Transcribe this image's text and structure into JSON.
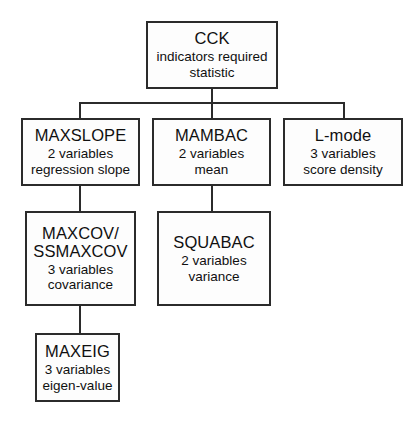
{
  "diagram": {
    "title": "CCK indicators required statistic",
    "type": "flowchart",
    "orientation": "top-down",
    "background_color": "#ffffff",
    "line_color": "#2b2b2b",
    "box_fill_color": "#fdfdfd",
    "box_border_color": "#2b2b2b"
  },
  "nodes": {
    "cck": {
      "title": "CCK",
      "line2": "indicators required",
      "line3": "statistic"
    },
    "maxslope": {
      "title": "MAXSLOPE",
      "line2": "2 variables",
      "line3": "regression slope"
    },
    "mambac": {
      "title": "MAMBAC",
      "line2": "2 variables",
      "line3": "mean"
    },
    "lmode": {
      "title": "L-mode",
      "line2": "3 variables",
      "line3": "score density"
    },
    "maxcov": {
      "title_line1": "MAXCOV/",
      "title_line2": "SSMAXCOV",
      "line3": "3 variables",
      "line4": "covariance"
    },
    "squabac": {
      "title": "SQUABAC",
      "line2": "2 variables",
      "line3": "variance"
    },
    "maxeig": {
      "title": "MAXEIG",
      "line2": "3 variables",
      "line3": "eigen-value"
    }
  },
  "edges": [
    {
      "from": "cck",
      "to": "maxslope"
    },
    {
      "from": "cck",
      "to": "mambac"
    },
    {
      "from": "cck",
      "to": "lmode"
    },
    {
      "from": "maxslope",
      "to": "maxcov"
    },
    {
      "from": "mambac",
      "to": "squabac"
    },
    {
      "from": "maxcov",
      "to": "maxeig"
    }
  ]
}
